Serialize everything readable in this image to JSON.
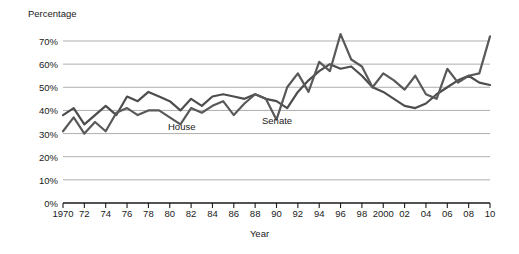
{
  "chart_data": {
    "type": "line",
    "title": "",
    "xlabel": "Year",
    "ylabel": "Percentage",
    "ylim": [
      0,
      75
    ],
    "xlim": [
      1970,
      2010
    ],
    "grid": true,
    "legend_position": "inline-annotations",
    "ytick_labels": [
      "0%",
      "10%",
      "20%",
      "30%",
      "40%",
      "50%",
      "60%",
      "70%"
    ],
    "ytick_values": [
      0,
      10,
      20,
      30,
      40,
      50,
      60,
      70
    ],
    "xtick_labels": [
      "1970",
      "72",
      "74",
      "76",
      "78",
      "80",
      "82",
      "84",
      "86",
      "88",
      "90",
      "92",
      "94",
      "96",
      "98",
      "2000",
      "02",
      "04",
      "06",
      "08",
      "10"
    ],
    "xtick_values": [
      1970,
      1972,
      1974,
      1976,
      1978,
      1980,
      1982,
      1984,
      1986,
      1988,
      1990,
      1992,
      1994,
      1996,
      1998,
      2000,
      2002,
      2004,
      2006,
      2008,
      2010
    ],
    "x": [
      1970,
      1971,
      1972,
      1973,
      1974,
      1975,
      1976,
      1977,
      1978,
      1979,
      1980,
      1981,
      1982,
      1983,
      1984,
      1985,
      1986,
      1987,
      1988,
      1989,
      1990,
      1991,
      1992,
      1993,
      1994,
      1995,
      1996,
      1997,
      1998,
      1999,
      2000,
      2001,
      2002,
      2003,
      2004,
      2005,
      2006,
      2007,
      2008,
      2009,
      2010
    ],
    "series": [
      {
        "name": "House",
        "color": "#4d4d4d",
        "values": [
          38,
          41,
          34,
          38,
          42,
          38,
          46,
          44,
          48,
          46,
          44,
          40,
          45,
          42,
          46,
          47,
          46,
          45,
          47,
          45,
          44,
          41,
          48,
          53,
          57,
          60,
          58,
          59,
          55,
          50,
          48,
          45,
          42,
          41,
          43,
          47,
          50,
          53,
          55,
          52,
          51
        ],
        "linewidth": 2.2
      },
      {
        "name": "Senate",
        "color": "#595959",
        "values": [
          31,
          37,
          30,
          35,
          31,
          39,
          41,
          38,
          40,
          40,
          37,
          34,
          41,
          39,
          42,
          44,
          38,
          43,
          47,
          45,
          36,
          50,
          56,
          48,
          61,
          57,
          73,
          62,
          59,
          50,
          56,
          53,
          49,
          55,
          47,
          45,
          58,
          52,
          55,
          56,
          72
        ],
        "linewidth": 2.2
      }
    ],
    "annotations": [
      {
        "text": "House",
        "x": 1979.5,
        "y": 34
      },
      {
        "text": "Senate",
        "x": 1989.0,
        "y": 37
      }
    ]
  },
  "labels": {
    "ylabel": "Percentage",
    "xlabel": "Year",
    "house": "House",
    "senate": "Senate"
  }
}
